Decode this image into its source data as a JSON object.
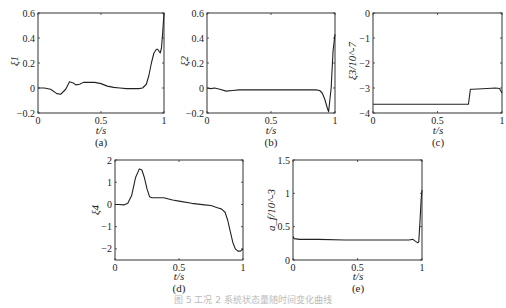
{
  "figure_caption": "图 5  工况 2 系统状态量随时间变化曲线",
  "chart_data": [
    {
      "id": "a",
      "type": "line",
      "panel_label": "(a)",
      "xlabel": "t/s",
      "ylabel": "ξ1",
      "xlim": [
        0,
        1
      ],
      "ylim": [
        -0.2,
        0.6
      ],
      "xticks": [
        "0",
        "0.5",
        "1"
      ],
      "yticks": [
        "-0.2",
        "0",
        "0.2",
        "0.4",
        "0.6"
      ],
      "grid": false,
      "x": [
        0,
        0.05,
        0.1,
        0.15,
        0.18,
        0.22,
        0.25,
        0.28,
        0.3,
        0.33,
        0.36,
        0.4,
        0.45,
        0.5,
        0.55,
        0.6,
        0.65,
        0.7,
        0.75,
        0.8,
        0.83,
        0.86,
        0.88,
        0.9,
        0.92,
        0.94,
        0.95,
        0.97,
        0.98,
        0.99,
        1.0
      ],
      "y": [
        0,
        0,
        -0.01,
        -0.045,
        -0.05,
        -0.01,
        0.05,
        0.04,
        0.025,
        0.03,
        0.045,
        0.045,
        0.045,
        0.035,
        0.015,
        0.005,
        0,
        -0.005,
        -0.005,
        -0.005,
        0.0,
        0.03,
        0.1,
        0.2,
        0.28,
        0.31,
        0.31,
        0.28,
        0.32,
        0.45,
        0.6
      ]
    },
    {
      "id": "b",
      "type": "line",
      "panel_label": "(b)",
      "xlabel": "t/s",
      "ylabel": "ξ2",
      "xlim": [
        0,
        1
      ],
      "ylim": [
        -0.2,
        0.6
      ],
      "xticks": [
        "0",
        "0.5",
        "1"
      ],
      "yticks": [
        "-0.2",
        "0",
        "0.2",
        "0.4",
        "0.6"
      ],
      "grid": false,
      "x": [
        0,
        0.03,
        0.06,
        0.1,
        0.15,
        0.2,
        0.25,
        0.3,
        0.4,
        0.5,
        0.6,
        0.7,
        0.8,
        0.85,
        0.88,
        0.9,
        0.92,
        0.94,
        0.95,
        0.97,
        0.985,
        1.0
      ],
      "y": [
        0,
        -0.005,
        0,
        -0.01,
        -0.025,
        -0.02,
        -0.015,
        -0.015,
        -0.015,
        -0.015,
        -0.015,
        -0.015,
        -0.015,
        -0.015,
        -0.02,
        -0.04,
        -0.09,
        -0.16,
        -0.19,
        0.0,
        0.3,
        0.43
      ]
    },
    {
      "id": "c",
      "type": "line",
      "panel_label": "(c)",
      "xlabel": "t/s",
      "ylabel": "ξ3/10^-7",
      "xlim": [
        0,
        1
      ],
      "ylim": [
        -4,
        0
      ],
      "xticks": [
        "0",
        "0.5",
        "1"
      ],
      "yticks": [
        "-4",
        "-3",
        "-2",
        "-1",
        "0"
      ],
      "grid": false,
      "x": [
        0,
        0.2,
        0.4,
        0.6,
        0.74,
        0.755,
        0.77,
        0.85,
        0.95,
        0.98,
        1.0
      ],
      "y": [
        -3.65,
        -3.65,
        -3.65,
        -3.65,
        -3.65,
        -3.05,
        -3.05,
        -3.03,
        -3.0,
        -3.02,
        -3.2
      ]
    },
    {
      "id": "d",
      "type": "line",
      "panel_label": "(d)",
      "xlabel": "t/s",
      "ylabel": "ξ4",
      "xlim": [
        0,
        1
      ],
      "ylim": [
        -2.5,
        2
      ],
      "xticks": [
        "0",
        "0.5",
        "1"
      ],
      "yticks": [
        "-2",
        "-1",
        "0",
        "1",
        "2"
      ],
      "grid": false,
      "x": [
        0,
        0.03,
        0.07,
        0.1,
        0.13,
        0.16,
        0.19,
        0.21,
        0.23,
        0.25,
        0.27,
        0.29,
        0.32,
        0.38,
        0.45,
        0.5,
        0.6,
        0.7,
        0.75,
        0.8,
        0.83,
        0.86,
        0.88,
        0.9,
        0.92,
        0.94,
        0.96,
        0.98,
        1.0
      ],
      "y": [
        0.0,
        0.0,
        -0.02,
        0.05,
        0.4,
        1.2,
        1.6,
        1.55,
        1.2,
        0.7,
        0.35,
        0.3,
        0.3,
        0.3,
        0.2,
        0.15,
        0.05,
        -0.02,
        -0.05,
        -0.15,
        -0.2,
        -0.35,
        -0.7,
        -1.2,
        -1.7,
        -2.0,
        -2.1,
        -2.1,
        -2.0
      ]
    },
    {
      "id": "e",
      "type": "line",
      "panel_label": "(e)",
      "xlabel": "t/s",
      "ylabel": "a_f/10^-3",
      "xlim": [
        0,
        1
      ],
      "ylim": [
        0,
        1.5
      ],
      "xticks": [
        "0",
        "0.5",
        "1"
      ],
      "yticks": [
        "0",
        "0.5",
        "1",
        "1.5"
      ],
      "grid": false,
      "x": [
        0,
        0.01,
        0.05,
        0.2,
        0.4,
        0.6,
        0.8,
        0.9,
        0.93,
        0.95,
        0.965,
        0.975,
        0.985,
        0.993,
        1.0
      ],
      "y": [
        0.35,
        0.32,
        0.31,
        0.31,
        0.3,
        0.3,
        0.3,
        0.3,
        0.31,
        0.28,
        0.26,
        0.27,
        0.6,
        0.9,
        1.05
      ]
    }
  ]
}
